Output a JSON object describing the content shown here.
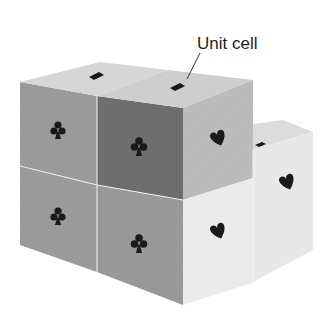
{
  "figure": {
    "annotation": "Unit cell",
    "colors": {
      "background": "#ffffff",
      "left_face": "#9a9a9a",
      "unit_cell_front": "#6e6e6e",
      "top_face": "#d2d2d2",
      "right_face": "#e6e6e6",
      "back_cube_top": "#dcdcdc",
      "symbol": "#1a1a1a"
    },
    "cubes": [
      {
        "position": "top-left",
        "visible_symbols": [
          "diamond",
          "club"
        ]
      },
      {
        "position": "top-front (unit cell)",
        "visible_symbols": [
          "diamond",
          "club",
          "heart"
        ]
      },
      {
        "position": "bottom-left",
        "visible_symbols": [
          "club"
        ]
      },
      {
        "position": "bottom-front",
        "visible_symbols": [
          "club",
          "heart"
        ]
      },
      {
        "position": "back-right",
        "visible_symbols": [
          "diamond",
          "heart"
        ]
      }
    ]
  }
}
